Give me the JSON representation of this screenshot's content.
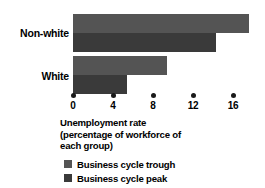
{
  "chart_data": {
    "type": "bar",
    "orientation": "horizontal",
    "title": "",
    "xlabel": "Unemployment rate (percentage of workforce of each group)",
    "ylabel": "",
    "categories": [
      "Non-white",
      "White"
    ],
    "series": [
      {
        "name": "Business cycle trough",
        "color": "#545454",
        "values": [
          17.6,
          9.4
        ]
      },
      {
        "name": "Business cycle peak",
        "color": "#3a3a3a",
        "values": [
          14.3,
          5.4
        ]
      }
    ],
    "xlim": [
      0,
      16
    ],
    "xticks": [
      0,
      4,
      8,
      12,
      16
    ],
    "xtick_labels": [
      "0",
      "4",
      "8",
      "12",
      "16"
    ],
    "grid": false,
    "legend_position": "bottom-left"
  },
  "axis_title_lines": [
    "Unemployment rate",
    "(percentage of workforce of",
    "each group)"
  ],
  "colors": {
    "background": "#ffffff",
    "text": "#000000",
    "tick_dot": "#1a1a1a",
    "trough": "#545454",
    "peak": "#3a3a3a"
  }
}
